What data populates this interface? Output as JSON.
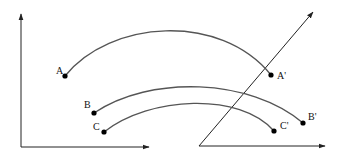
{
  "diagram": {
    "colors": {
      "axis": "#222222",
      "arc": "#555555",
      "point": "#000000",
      "background": "#ffffff"
    },
    "left_axes": {
      "origin": [
        21,
        147
      ],
      "y_tip": [
        21,
        13
      ],
      "x_tip": [
        150,
        147
      ]
    },
    "right_axes": {
      "origin": [
        199,
        146
      ],
      "oblique_tip": [
        314,
        11
      ],
      "x_tip": [
        326,
        146
      ]
    },
    "points": [
      {
        "id": "A",
        "label": "A",
        "x": 65,
        "y": 76
      },
      {
        "id": "B",
        "label": "B",
        "x": 94,
        "y": 113
      },
      {
        "id": "C",
        "label": "C",
        "x": 104,
        "y": 132
      },
      {
        "id": "A2",
        "label": "A'",
        "x": 271,
        "y": 75
      },
      {
        "id": "B2",
        "label": "B'",
        "x": 303,
        "y": 123
      },
      {
        "id": "C2",
        "label": "C'",
        "x": 274,
        "y": 131
      }
    ],
    "arcs": [
      {
        "from": "A",
        "to": "A'"
      },
      {
        "from": "B",
        "to": "B'"
      },
      {
        "from": "C",
        "to": "C'"
      }
    ],
    "labels": {
      "A": "A",
      "B": "B",
      "C": "C",
      "A2": "A'",
      "B2": "B'",
      "C2": "C'"
    }
  }
}
